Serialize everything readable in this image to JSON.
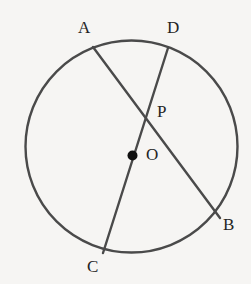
{
  "figure": {
    "background_color": "#f6f5f3",
    "stroke_color": "#4a4a4a",
    "label_color": "#242424",
    "point_fill_color": "#101010"
  },
  "circle": {
    "name": "circle-O",
    "center_x": 131.5,
    "center_y": 146.5,
    "radius": 106,
    "stroke_width": 2.4
  },
  "points": {
    "A": {
      "label": "A",
      "x": 93,
      "y": 47,
      "on_circle": true,
      "marked": false
    },
    "D": {
      "label": "D",
      "x": 168,
      "y": 48,
      "on_circle": true,
      "marked": false
    },
    "B": {
      "label": "B",
      "x": 220,
      "y": 218,
      "on_circle": true,
      "marked": false
    },
    "C": {
      "label": "C",
      "x": 103,
      "y": 253,
      "on_circle": true,
      "marked": false
    },
    "P": {
      "label": "P",
      "x": 143,
      "y": 113,
      "on_circle": false,
      "marked": false
    },
    "O": {
      "label": "O",
      "x": 132.5,
      "y": 155.5,
      "on_circle": false,
      "marked": true,
      "dot_radius": 5
    }
  },
  "segments": [
    {
      "name": "chord-AB",
      "label": "AB",
      "from": "A",
      "to": "B",
      "kind": "chord",
      "stroke_width": 2.4
    },
    {
      "name": "diameter-DC",
      "label": "DC",
      "from": "D",
      "to": "C",
      "kind": "diameter",
      "stroke_width": 2.4
    }
  ],
  "labels": {
    "A": "A",
    "D": "D",
    "P": "P",
    "O": "O",
    "B": "B",
    "C": "C"
  }
}
